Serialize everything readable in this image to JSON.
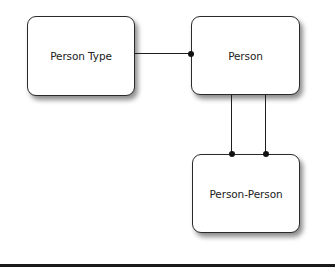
{
  "diagram": {
    "type": "entity-relationship",
    "entities": [
      {
        "id": "person-type",
        "label": "Person Type"
      },
      {
        "id": "person",
        "label": "Person"
      },
      {
        "id": "person-person",
        "label": "Person-Person"
      }
    ],
    "relationships": [
      {
        "from": "person-type",
        "to": "person",
        "end_marker": "dot-at-person"
      },
      {
        "from": "person",
        "to": "person-person",
        "end_marker": "dot-at-person-person"
      },
      {
        "from": "person",
        "to": "person-person",
        "end_marker": "dot-at-person-person"
      }
    ]
  }
}
